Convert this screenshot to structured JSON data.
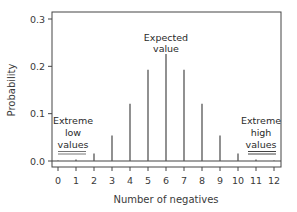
{
  "chart_data": {
    "type": "bar",
    "subtype": "stem",
    "title": "",
    "xlabel": "Number of negatives",
    "ylabel": "Probability",
    "categories": [
      "0",
      "1",
      "2",
      "3",
      "4",
      "5",
      "6",
      "7",
      "8",
      "9",
      "10",
      "11",
      "12"
    ],
    "x": [
      0,
      1,
      2,
      3,
      4,
      5,
      6,
      7,
      8,
      9,
      10,
      11,
      12
    ],
    "values": [
      0.0002,
      0.003,
      0.016,
      0.054,
      0.121,
      0.193,
      0.226,
      0.193,
      0.121,
      0.054,
      0.016,
      0.003,
      0.0002
    ],
    "xlim": [
      0,
      12
    ],
    "ylim": [
      0.0,
      0.3
    ],
    "yticks": [
      "0.0",
      "0.1",
      "0.2",
      "0.3"
    ],
    "xticks": [
      "0",
      "1",
      "2",
      "3",
      "4",
      "5",
      "6",
      "7",
      "8",
      "9",
      "10",
      "11",
      "12"
    ],
    "grid": false,
    "legend": null,
    "annotations": [
      {
        "text": [
          "Expected",
          "value"
        ],
        "x": 6
      },
      {
        "text": [
          "Extreme",
          "low",
          "values"
        ],
        "x": 1,
        "underline": "double"
      },
      {
        "text": [
          "Extreme",
          "high",
          "values"
        ],
        "x": 11,
        "underline": "double"
      }
    ]
  },
  "labels": {
    "xlabel": "Number of negatives",
    "ylabel": "Probability",
    "expected": [
      "Expected",
      "value"
    ],
    "low": [
      "Extreme",
      "low",
      "values"
    ],
    "high": [
      "Extreme",
      "high",
      "values"
    ]
  },
  "colors": {
    "stem": "#555555",
    "axis": "#444444",
    "text": "#333333",
    "underline": "#555555"
  }
}
